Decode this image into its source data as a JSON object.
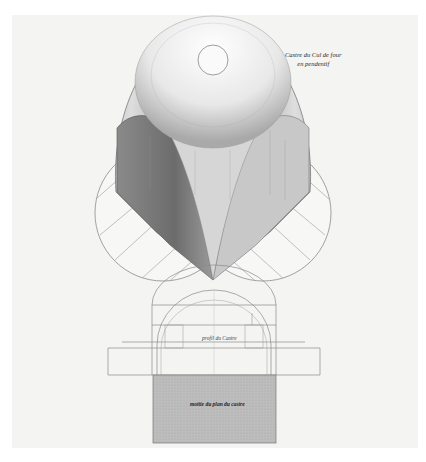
{
  "document": {
    "type": "architectural engraving plate",
    "labels": {
      "top_right": {
        "line1": "Castre du Cul de four",
        "line2": "en pendentif"
      },
      "profile": "profil du Castre",
      "plan": "moitie du plan du castre"
    },
    "colors": {
      "paper": "#f4f4f3",
      "ink": "#555555",
      "shade_dark": "#6f6f6f",
      "shade_mid": "#b8b8b8",
      "plan_fill": "#b9b9b9"
    }
  }
}
